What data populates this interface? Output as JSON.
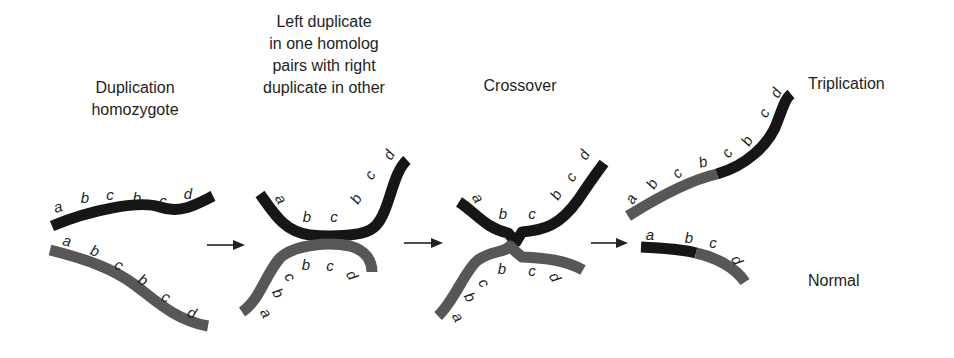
{
  "colors": {
    "dark_strand": "#161616",
    "gray_strand": "#575757",
    "text": "#1e1e1e",
    "background": "#ffffff"
  },
  "captions": [
    {
      "id": "duplication-homozygote",
      "lines": [
        "Duplication",
        "homozygote"
      ],
      "x": 135,
      "y": 77
    },
    {
      "id": "left-pairs-right",
      "lines": [
        "Left duplicate",
        "in one homolog",
        "pairs with right",
        "duplicate in other"
      ],
      "x": 324,
      "y": 11
    },
    {
      "id": "crossover",
      "lines": [
        "Crossover"
      ],
      "x": 520,
      "y": 77
    },
    {
      "id": "triplication",
      "lines": [
        "Triplication"
      ],
      "x": 856,
      "y": 74
    },
    {
      "id": "normal",
      "lines": [
        "Normal"
      ],
      "x": 840,
      "y": 270
    }
  ],
  "stages": [
    {
      "name": "Duplication homozygote",
      "strands": [
        {
          "color": "dark",
          "path": "M 52 226 C 90 210, 140 200, 160 207 C 180 214, 195 205, 213 196",
          "genes": [
            "a",
            "b",
            "c",
            "b",
            "c",
            "d"
          ],
          "labels": [
            [
              58,
              212,
              -15
            ],
            [
              85,
              203,
              0
            ],
            [
              110,
              200,
              0
            ],
            [
              137,
              203,
              0
            ],
            [
              163,
              206,
              0
            ],
            [
              188,
              199,
              0
            ]
          ]
        },
        {
          "color": "gray",
          "path": "M 50 250 C 90 260, 115 270, 135 285 C 155 300, 175 320, 208 326",
          "genes": [
            "a",
            "b",
            "c",
            "b",
            "c",
            "d"
          ],
          "labels": [
            [
              67,
              246,
              15
            ],
            [
              95,
              256,
              20
            ],
            [
              119,
              270,
              30
            ],
            [
              143,
              285,
              30
            ],
            [
              166,
              302,
              30
            ],
            [
              192,
              318,
              20
            ]
          ]
        }
      ]
    },
    {
      "name": "Left duplicate in one homolog pairs with right duplicate in other",
      "strands": [
        {
          "color": "dark",
          "path": "M 260 194 C 275 215, 285 232, 310 235 C 330 237, 360 236, 370 230 C 390 220, 390 175, 407 160",
          "genes": [
            "a",
            "b",
            "c",
            "b",
            "c",
            "d"
          ],
          "labels": [
            [
              281,
              204,
              60
            ],
            [
              307,
              222,
              0
            ],
            [
              334,
              222,
              0
            ],
            [
              356,
              204,
              -60
            ],
            [
              370,
              180,
              -60
            ],
            [
              389,
              160,
              -60
            ]
          ]
        },
        {
          "color": "gray",
          "path": "M 242 312 C 260 300, 265 275, 280 258 C 295 244, 330 242, 350 246 C 365 250, 372 260, 372 272",
          "genes": [
            "a",
            "b",
            "c",
            "b",
            "c",
            "d"
          ],
          "labels": [
            [
              266,
              318,
              60
            ],
            [
              278,
              298,
              60
            ],
            [
              290,
              282,
              60
            ],
            [
              306,
              270,
              0
            ],
            [
              330,
              271,
              0
            ],
            [
              352,
              280,
              60
            ]
          ]
        }
      ]
    },
    {
      "name": "Crossover",
      "strands": [
        {
          "color": "dark",
          "path": "M 459 202 C 475 212, 485 228, 508 233 L 516 242 L 522 232 C 545 230, 560 225, 578 200 C 590 182, 595 175, 604 163",
          "genes": [
            "a",
            "b",
            "c",
            "b",
            "c",
            "d"
          ],
          "labels": [
            [
              478,
              203,
              60
            ],
            [
              503,
              219,
              0
            ],
            [
              532,
              219,
              0
            ],
            [
              556,
              200,
              -60
            ],
            [
              571,
              182,
              -60
            ],
            [
              584,
              160,
              -60
            ]
          ]
        },
        {
          "color": "gray",
          "path": "M 438 316 C 455 300, 465 270, 478 260 C 492 250, 505 253, 510 246 L 516 252 L 522 257 C 545 258, 565 260, 583 270",
          "genes": [
            "a",
            "b",
            "c",
            "b",
            "c",
            "d"
          ],
          "labels": [
            [
              458,
              322,
              60
            ],
            [
              470,
              302,
              60
            ],
            [
              484,
              288,
              60
            ],
            [
              502,
              274,
              0
            ],
            [
              532,
              276,
              0
            ],
            [
              555,
              282,
              60
            ]
          ]
        }
      ]
    },
    {
      "name": "Result",
      "strands": [
        {
          "color": "gray",
          "path": "M 628 216 C 660 196, 690 180, 717 174",
          "genes": [
            "a",
            "b",
            "c",
            "b"
          ],
          "labels": [
            [
              631,
              204,
              -60
            ],
            [
              652,
              189,
              -60
            ],
            [
              677,
              178,
              -45
            ],
            [
              703,
              167,
              -15
            ]
          ]
        },
        {
          "color": "dark",
          "path": "M 717 174 C 745 166, 770 145, 778 120 C 784 104, 786 98, 791 94",
          "genes": [
            "c",
            "b",
            "c",
            "d"
          ],
          "labels": [
            [
              727,
              158,
              -60
            ],
            [
              747,
              146,
              -60
            ],
            [
              764,
              118,
              -60
            ],
            [
              776,
              98,
              -60
            ]
          ]
        },
        {
          "color": "dark",
          "path": "M 641 247 C 665 248, 685 250, 696 253",
          "genes": [
            "a",
            "b"
          ],
          "labels": [
            [
              650,
              240,
              0
            ],
            [
              689,
              243,
              0
            ]
          ]
        },
        {
          "color": "gray",
          "path": "M 696 253 C 715 257, 735 267, 745 282",
          "genes": [
            "c",
            "d"
          ],
          "labels": [
            [
              713,
              248,
              0
            ],
            [
              737,
              265,
              60
            ]
          ]
        }
      ]
    }
  ],
  "arrows": [
    {
      "from": [
        207,
        245
      ],
      "to": [
        245,
        245
      ]
    },
    {
      "from": [
        404,
        243
      ],
      "to": [
        443,
        243
      ]
    },
    {
      "from": [
        591,
        243
      ],
      "to": [
        628,
        243
      ]
    }
  ]
}
